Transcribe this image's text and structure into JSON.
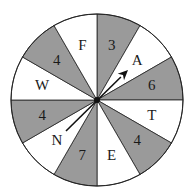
{
  "spinner": {
    "center": [
      97,
      100
    ],
    "radius": 86,
    "colors": {
      "shaded": "#9a9a9a",
      "unshaded": "#ffffff",
      "outline": "#222222",
      "arrow": "#111111"
    },
    "sectors": [
      {
        "label": "3",
        "shaded": true
      },
      {
        "label": "A",
        "shaded": false
      },
      {
        "label": "6",
        "shaded": true
      },
      {
        "label": "T",
        "shaded": false
      },
      {
        "label": "4",
        "shaded": true
      },
      {
        "label": "E",
        "shaded": false
      },
      {
        "label": "7",
        "shaded": true
      },
      {
        "label": "N",
        "shaded": false
      },
      {
        "label": "4",
        "shaded": true
      },
      {
        "label": "W",
        "shaded": false
      },
      {
        "label": "4",
        "shaded": true
      },
      {
        "label": "F",
        "shaded": false
      }
    ],
    "arrow": {
      "from": [
        66,
        131
      ],
      "to": [
        128,
        70
      ]
    }
  }
}
